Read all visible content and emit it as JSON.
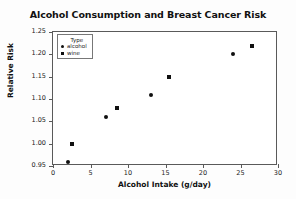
{
  "chart_data": {
    "type": "scatter",
    "title": "Alcohol Consumption and Breast Cancer Risk",
    "xlabel": "Alcohol Intake (g/day)",
    "ylabel": "Relative Risk",
    "xlim": [
      0,
      30
    ],
    "ylim": [
      0.95,
      1.25
    ],
    "xticks": [
      0,
      5,
      10,
      15,
      20,
      25,
      30
    ],
    "xtick_labels": [
      "0",
      "5",
      "10",
      "15",
      "20",
      "25",
      "30"
    ],
    "yticks": [
      0.95,
      1.0,
      1.05,
      1.1,
      1.15,
      1.2,
      1.25
    ],
    "ytick_labels": [
      "0.95",
      "1.00",
      "1.05",
      "1.10",
      "1.15",
      "1.20",
      "1.25"
    ],
    "grid": false,
    "legend": {
      "title": "Type",
      "position": "top-left",
      "entries": [
        {
          "label": "alcohol",
          "marker": "circle"
        },
        {
          "label": "wine",
          "marker": "square"
        }
      ]
    },
    "series": [
      {
        "name": "alcohol",
        "marker": "circle",
        "points": [
          {
            "x": 2.0,
            "y": 0.96
          },
          {
            "x": 7.0,
            "y": 1.06
          },
          {
            "x": 13.0,
            "y": 1.11
          },
          {
            "x": 24.0,
            "y": 1.2
          }
        ]
      },
      {
        "name": "wine",
        "marker": "square",
        "points": [
          {
            "x": 2.5,
            "y": 1.0
          },
          {
            "x": 8.5,
            "y": 1.08
          },
          {
            "x": 15.5,
            "y": 1.15
          },
          {
            "x": 26.5,
            "y": 1.218
          }
        ]
      }
    ]
  }
}
